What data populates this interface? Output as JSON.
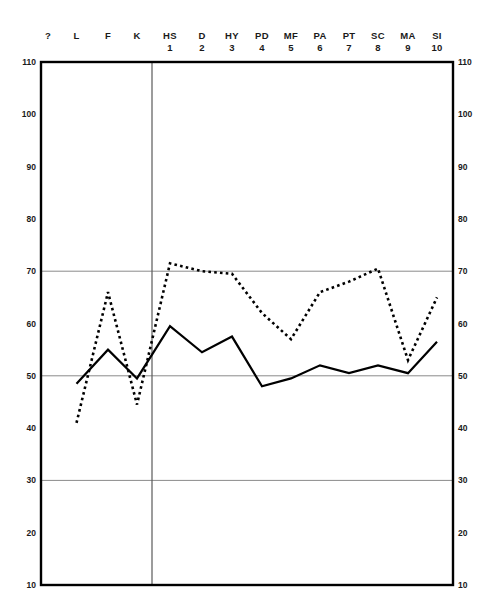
{
  "chart_data": {
    "type": "line",
    "title": "",
    "xlabel": "",
    "ylabel": "",
    "ylim": [
      10,
      110
    ],
    "grid": true,
    "gridlines_y": [
      70,
      50,
      30
    ],
    "legend_position": "none",
    "categories": [
      "?",
      "L",
      "F",
      "K",
      "HS",
      "D",
      "HY",
      "PD",
      "MF",
      "PA",
      "PT",
      "SC",
      "MA",
      "SI"
    ],
    "category_numbers": [
      "",
      "",
      "",
      "",
      "1",
      "2",
      "3",
      "4",
      "5",
      "6",
      "7",
      "8",
      "9",
      "10"
    ],
    "yticks": [
      110,
      100,
      90,
      80,
      70,
      60,
      50,
      40,
      30,
      20,
      10
    ],
    "yticks_right": [
      110,
      100,
      90,
      80,
      70,
      60,
      50,
      40,
      30,
      20,
      10
    ],
    "series": [
      {
        "name": "solid-profile",
        "style": "solid",
        "color": "#000000",
        "x": [
          "L",
          "F",
          "K",
          "HS",
          "D",
          "HY",
          "PD",
          "MF",
          "PA",
          "PT",
          "SC",
          "MA",
          "SI"
        ],
        "values": [
          48.5,
          55,
          49.5,
          59.5,
          54.5,
          57.5,
          48,
          49.5,
          52,
          50.5,
          52,
          50.5,
          56.5
        ]
      },
      {
        "name": "dotted-profile",
        "style": "dotted",
        "color": "#000000",
        "x": [
          "L",
          "F",
          "K",
          "HS",
          "D",
          "HY",
          "PD",
          "MF",
          "PA",
          "PT",
          "SC",
          "MA",
          "SI"
        ],
        "values": [
          41,
          66,
          44.5,
          71.5,
          70,
          69.5,
          62,
          57,
          66,
          68,
          70.5,
          53,
          65
        ]
      }
    ]
  },
  "headers": [
    {
      "abbr": "?",
      "num": ""
    },
    {
      "abbr": "L",
      "num": ""
    },
    {
      "abbr": "F",
      "num": ""
    },
    {
      "abbr": "K",
      "num": ""
    },
    {
      "abbr": "HS",
      "num": "1"
    },
    {
      "abbr": "D",
      "num": "2"
    },
    {
      "abbr": "HY",
      "num": "3"
    },
    {
      "abbr": "PD",
      "num": "4"
    },
    {
      "abbr": "MF",
      "num": "5"
    },
    {
      "abbr": "PA",
      "num": "6"
    },
    {
      "abbr": "PT",
      "num": "7"
    },
    {
      "abbr": "SC",
      "num": "8"
    },
    {
      "abbr": "MA",
      "num": "9"
    },
    {
      "abbr": "SI",
      "num": "10"
    }
  ],
  "axis": {
    "left": [
      "110",
      "100",
      "90",
      "80",
      "70",
      "60",
      "50",
      "40",
      "30",
      "20",
      "10"
    ],
    "right": [
      "110",
      "100",
      "90",
      "80",
      "70",
      "60",
      "50",
      "40",
      "30",
      "20",
      "10"
    ]
  },
  "colors": {
    "border": "#000000",
    "gridline": "#8a8a8a",
    "divider": "#5a5a5a",
    "line": "#000000"
  }
}
